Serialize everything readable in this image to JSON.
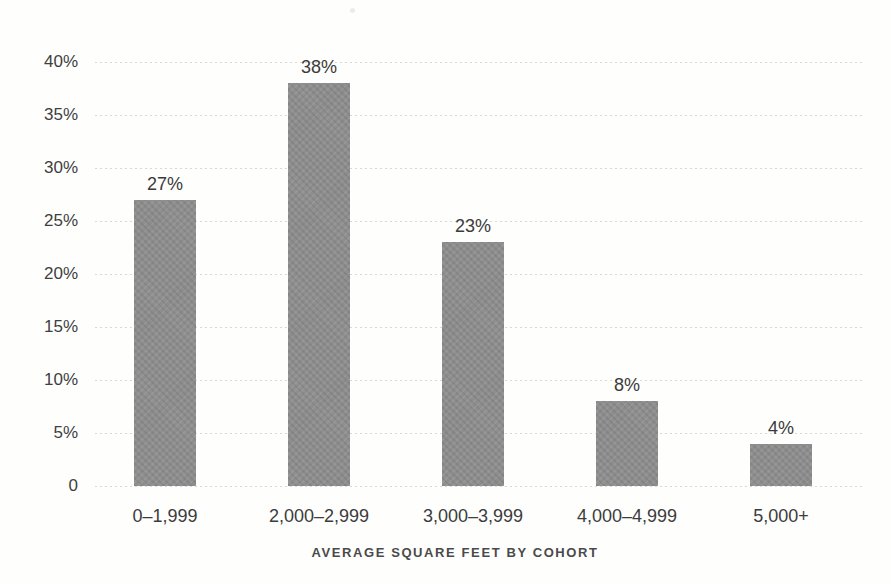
{
  "chart_data": {
    "type": "bar",
    "categories": [
      "0–1,999",
      "2,000–2,999",
      "3,000–3,999",
      "4,000–4,999",
      "5,000+"
    ],
    "values": [
      27,
      38,
      23,
      8,
      4
    ],
    "value_labels": [
      "27%",
      "38%",
      "23%",
      "8%",
      "4%"
    ],
    "title": "",
    "xlabel": "AVERAGE SQUARE FEET BY COHORT",
    "ylabel": "",
    "ylim": [
      0,
      40
    ],
    "ytick_step": 5,
    "ytick_labels": [
      "0",
      "5%",
      "10%",
      "15%",
      "20%",
      "25%",
      "30%",
      "35%",
      "40%"
    ],
    "grid": "horizontal-dotted",
    "legend": "none",
    "bar_color": "#8e8e8e",
    "text_color": "#3c3c3c",
    "grid_color": "#d9d9d2",
    "background_color": "#fefefd"
  }
}
